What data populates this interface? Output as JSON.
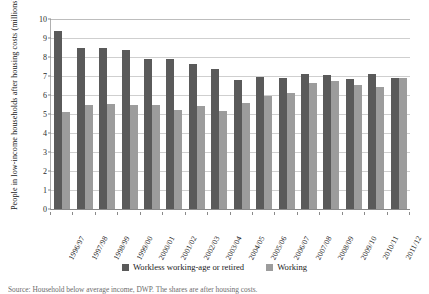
{
  "chart_data": {
    "type": "bar",
    "title": "",
    "xlabel": "",
    "ylabel": "People in low-income households after housing costs (millions)",
    "ylim": [
      0,
      10
    ],
    "yticks": [
      0,
      1,
      2,
      3,
      4,
      5,
      6,
      7,
      8,
      9,
      10
    ],
    "ytick_labels": [
      "0",
      "1",
      "2",
      "3",
      "4",
      "5",
      "6",
      "7",
      "8",
      "9",
      "10"
    ],
    "grid": true,
    "legend_position": "bottom",
    "categories": [
      "1996/97",
      "1997/98",
      "1998/99",
      "1999/00",
      "2000/01",
      "2001/02",
      "2002/03",
      "2003/04",
      "2004/05",
      "2005/06",
      "2006/07",
      "2007/08",
      "2008/09",
      "2009/10",
      "2010/11",
      "2011/12"
    ],
    "series": [
      {
        "name": "Workless working-age or retired",
        "color": "#5a5a5a",
        "values": [
          9.35,
          8.5,
          8.5,
          8.35,
          7.9,
          7.9,
          7.65,
          7.35,
          6.8,
          6.95,
          6.9,
          7.1,
          7.05,
          6.85,
          7.1,
          6.9
        ]
      },
      {
        "name": "Working",
        "color": "#9c9c9c",
        "values": [
          5.1,
          5.45,
          5.55,
          5.45,
          5.45,
          5.2,
          5.4,
          5.15,
          5.6,
          5.95,
          6.1,
          6.65,
          6.75,
          6.55,
          6.4,
          6.9
        ]
      }
    ]
  },
  "legend": {
    "entries": [
      {
        "label": "Workless working-age or retired",
        "color": "#5a5a5a"
      },
      {
        "label": "Working",
        "color": "#9c9c9c"
      }
    ]
  },
  "caption": {
    "text": "Source: Household below average income, DWP. The shares are after housing costs."
  },
  "colors": {
    "workless": "#5a5a5a",
    "working": "#9c9c9c",
    "grid": "#cfcfcf",
    "axis": "#8a8a8a"
  }
}
